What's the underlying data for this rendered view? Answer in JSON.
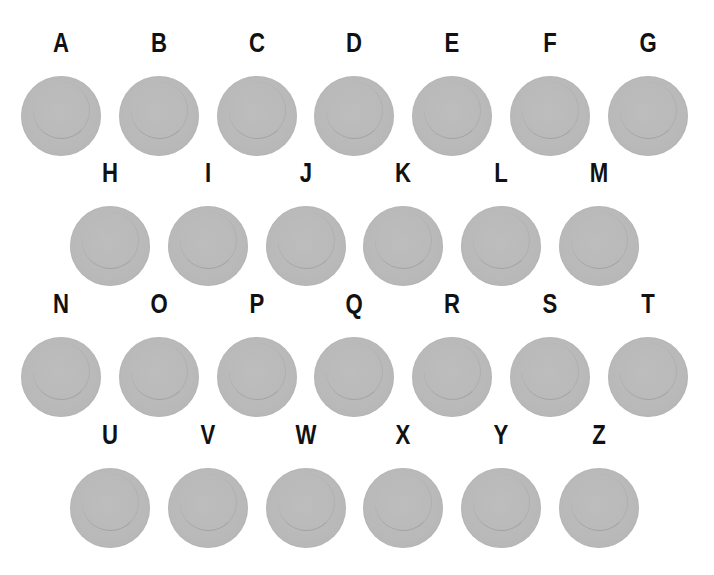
{
  "colors": {
    "disk_fill": "#b9b9b9",
    "letter": "#111111",
    "background": "#ffffff"
  },
  "rows": [
    {
      "y": 28,
      "x0": 12,
      "letters": [
        "A",
        "B",
        "C",
        "D",
        "E",
        "F",
        "G"
      ]
    },
    {
      "y": 158,
      "x0": 61,
      "letters": [
        "H",
        "I",
        "J",
        "K",
        "L",
        "M"
      ]
    },
    {
      "y": 289,
      "x0": 12,
      "letters": [
        "N",
        "O",
        "P",
        "Q",
        "R",
        "S",
        "T"
      ]
    },
    {
      "y": 420,
      "x0": 61,
      "letters": [
        "U",
        "V",
        "W",
        "X",
        "Y",
        "Z"
      ]
    }
  ],
  "spacing": 97.8
}
